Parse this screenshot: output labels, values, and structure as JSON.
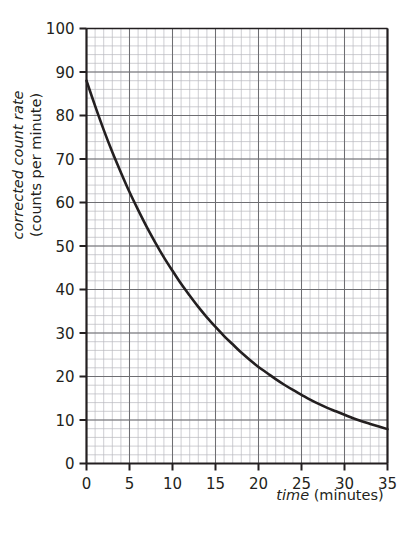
{
  "chart_data": {
    "type": "line",
    "title": "",
    "subtitle": "",
    "xlabel_italic": "time",
    "xlabel_rest": " (minutes)",
    "ylabel_line1": "corrected count rate",
    "ylabel_line2": "(counts per minute)",
    "xlim": [
      0,
      35
    ],
    "ylim": [
      0,
      100
    ],
    "x_major_ticks": [
      0,
      5,
      10,
      15,
      20,
      25,
      30,
      35
    ],
    "y_major_ticks": [
      0,
      10,
      20,
      30,
      40,
      50,
      60,
      70,
      80,
      90,
      100
    ],
    "x_tick_labels": [
      "0",
      "5",
      "10",
      "15",
      "20",
      "25",
      "30",
      "35"
    ],
    "y_tick_labels": [
      "0",
      "10",
      "20",
      "30",
      "40",
      "50",
      "60",
      "70",
      "80",
      "90",
      "100"
    ],
    "x_minor_step": 1,
    "y_minor_step": 2,
    "grid": true,
    "grid_minor": true,
    "legend": "none",
    "series": [
      {
        "name": "corrected count rate",
        "color": "#231f20",
        "x": [
          0,
          1,
          2,
          3,
          4,
          5,
          6,
          7,
          8,
          9,
          10,
          11,
          12,
          13,
          14,
          15,
          16,
          17,
          18,
          19,
          20,
          21,
          22,
          23,
          24,
          25,
          26,
          27,
          28,
          29,
          30,
          31,
          32,
          33,
          34,
          35
        ],
        "values": [
          88.0,
          82.2,
          76.7,
          71.6,
          66.9,
          62.4,
          58.3,
          54.4,
          50.8,
          47.4,
          44.3,
          41.3,
          38.6,
          36.0,
          33.6,
          31.4,
          29.3,
          27.4,
          25.5,
          23.8,
          22.2,
          20.8,
          19.4,
          18.1,
          16.9,
          15.8,
          14.7,
          13.7,
          12.8,
          12.0,
          11.2,
          10.4,
          9.7,
          9.1,
          8.5,
          7.9
        ]
      }
    ],
    "readings": {
      "t0": 88,
      "t5": 62,
      "t10": 44,
      "t15": 31,
      "t20": 22,
      "t25": 16,
      "t30": 11,
      "t35": 8
    }
  },
  "colors": {
    "curve": "#231f20",
    "axis": "#231f20",
    "grid_major": "#6e6e72",
    "grid_minor": "#b9b9be",
    "background": "#ffffff",
    "text": "#231f20"
  }
}
